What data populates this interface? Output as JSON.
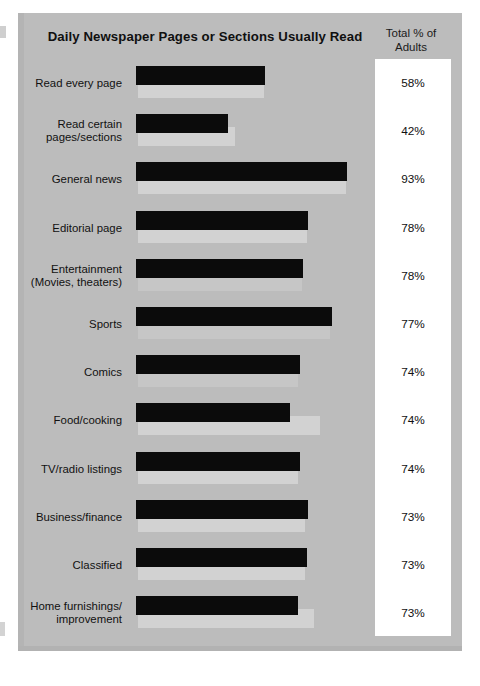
{
  "chart_data": {
    "type": "bar",
    "orientation": "horizontal",
    "title": "Daily  Newspaper Pages or Sections Usually Read",
    "value_column_header": "Total % of\nAdults",
    "value_column_header_line1": "Total % of",
    "value_column_header_line2": "Adults",
    "xlabel": "",
    "ylabel": "",
    "xlim": [
      0,
      100
    ],
    "grid": false,
    "legend": "none",
    "categories": [
      "Read every page",
      "Read certain pages/sections",
      "General news",
      "Editorial page",
      "Entertainment (Movies, theaters)",
      "Sports",
      "Comics",
      "Food/cooking",
      "TV/radio listings",
      "Business/finance",
      "Classified",
      "Home furnishings/ improvement"
    ],
    "values": [
      58,
      42,
      93,
      78,
      78,
      77,
      74,
      74,
      74,
      73,
      73,
      73
    ],
    "value_labels": [
      "58%",
      "42%",
      "93%",
      "78%",
      "78%",
      "77%",
      "74%",
      "74%",
      "74%",
      "73%",
      "73%",
      "73%"
    ]
  },
  "colors": {
    "panel_background": "#bcbcbc",
    "bar_fill": "#0b0b0b",
    "bar_shadow": "#d2d2d2",
    "value_box_background": "#ffffff",
    "text": "#111111",
    "page_background": "#ffffff"
  },
  "rows": [
    {
      "label_line1": "Read every page",
      "label_line2": "",
      "value": "58%",
      "bar_px": 129,
      "shadow_px": 126,
      "faint": false
    },
    {
      "label_line1": "Read certain",
      "label_line2": "pages/sections",
      "value": "42%",
      "bar_px": 92,
      "shadow_px": 97,
      "faint": false
    },
    {
      "label_line1": "General news",
      "label_line2": "",
      "value": "93%",
      "bar_px": 211,
      "shadow_px": 208,
      "faint": false
    },
    {
      "label_line1": "Editorial page",
      "label_line2": "",
      "value": "78%",
      "bar_px": 172,
      "shadow_px": 169,
      "faint": false
    },
    {
      "label_line1": "Entertainment",
      "label_line2": "(Movies, theaters)",
      "value": "78%",
      "bar_px": 167,
      "shadow_px": 164,
      "faint": true
    },
    {
      "label_line1": "Sports",
      "label_line2": "",
      "value": "77%",
      "bar_px": 196,
      "shadow_px": 192,
      "faint": true
    },
    {
      "label_line1": "Comics",
      "label_line2": "",
      "value": "74%",
      "bar_px": 164,
      "shadow_px": 160,
      "faint": true
    },
    {
      "label_line1": "Food/cooking",
      "label_line2": "",
      "value": "74%",
      "bar_px": 154,
      "shadow_px": 182,
      "faint": false
    },
    {
      "label_line1": "TV/radio listings",
      "label_line2": "",
      "value": "74%",
      "bar_px": 164,
      "shadow_px": 160,
      "faint": false
    },
    {
      "label_line1": "Business/finance",
      "label_line2": "",
      "value": "73%",
      "bar_px": 172,
      "shadow_px": 167,
      "faint": false
    },
    {
      "label_line1": "Classified",
      "label_line2": "",
      "value": "73%",
      "bar_px": 171,
      "shadow_px": 167,
      "faint": false
    },
    {
      "label_line1": "Home furnishings/",
      "label_line2": "improvement",
      "value": "73%",
      "bar_px": 162,
      "shadow_px": 176,
      "faint": false
    }
  ]
}
